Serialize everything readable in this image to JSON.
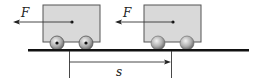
{
  "diagram": {
    "force_label": "F",
    "displacement_label": "s",
    "colors": {
      "cart_body": "#d9d9d9",
      "cart_border": "#444444",
      "ground": "#111111",
      "line": "#333333"
    },
    "carts": [
      {
        "name": "initial-cart",
        "wheel_style": "axle-dot"
      },
      {
        "name": "final-cart",
        "wheel_style": "sphere"
      }
    ]
  }
}
